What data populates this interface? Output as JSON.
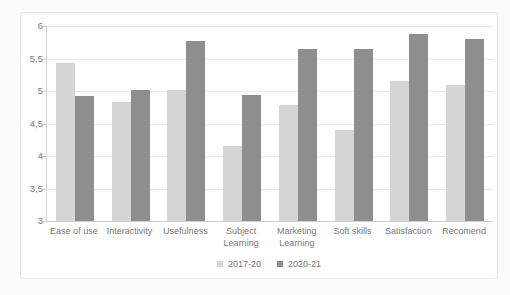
{
  "chart_data": {
    "type": "bar",
    "title": "",
    "xlabel": "",
    "ylabel": "",
    "categories": [
      "Ease of use",
      "Interactivity",
      "Usefulness",
      "Subject Learning",
      "Marketing Learning",
      "Soft skills",
      "Satisfaction",
      "Recomend"
    ],
    "series": [
      {
        "name": "2017-20",
        "color": "#d5d5d3",
        "values": [
          5.43,
          4.83,
          5.02,
          4.16,
          4.79,
          4.4,
          5.16,
          5.09
        ]
      },
      {
        "name": "2020-21",
        "color": "#8e8e8c",
        "values": [
          4.92,
          5.01,
          5.77,
          4.94,
          5.65,
          5.65,
          5.87,
          5.8
        ]
      }
    ],
    "ylim": [
      3,
      6
    ],
    "y_ticks": [
      "6",
      "5,5",
      "5",
      "4,5",
      "4",
      "3,5",
      "3"
    ],
    "grid": true,
    "legend_position": "bottom"
  },
  "colors": {
    "background": "#fbfbf9",
    "chart_background": "#ffffff",
    "gridline": "#ebebe9",
    "axis_text": "#787876"
  }
}
